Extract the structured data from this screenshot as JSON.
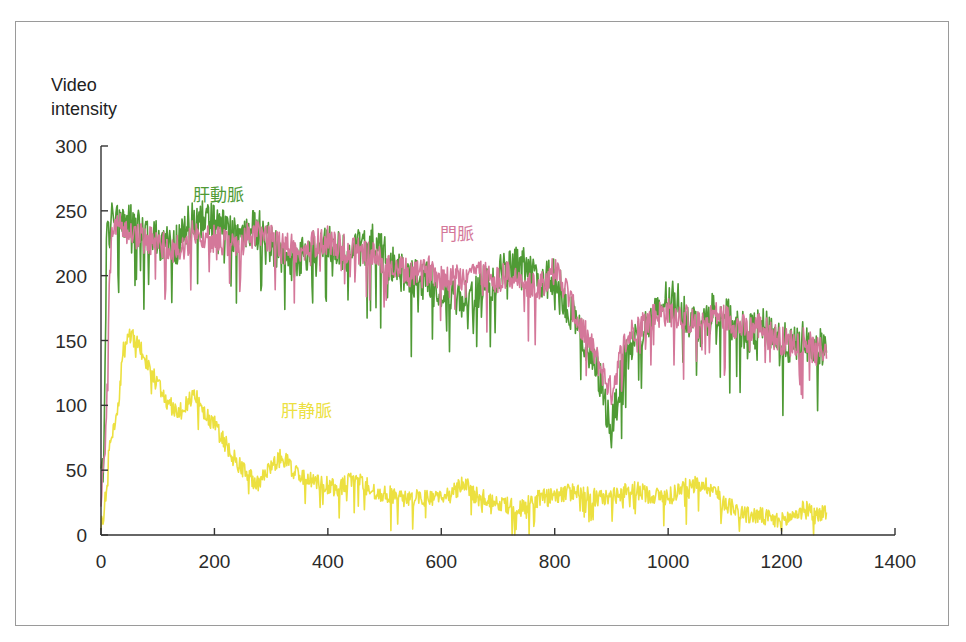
{
  "chart_data": {
    "type": "line",
    "title": "",
    "xlabel": "",
    "ylabel": "Video intensity",
    "ylabel_lines": [
      "Video",
      "intensity"
    ],
    "xlim": [
      0,
      1400
    ],
    "ylim": [
      0,
      300
    ],
    "x_ticks": [
      0,
      200,
      400,
      600,
      800,
      1000,
      1200,
      1400
    ],
    "y_ticks": [
      0,
      50,
      100,
      150,
      200,
      250,
      300
    ],
    "grid": false,
    "legend": "inline labels",
    "series": [
      {
        "name": "肝動脈",
        "color": "#4f9a35",
        "label_pos": {
          "left": 193,
          "top": 181
        },
        "x": [
          0,
          5,
          10,
          15,
          20,
          30,
          50,
          80,
          100,
          120,
          140,
          150,
          160,
          180,
          200,
          220,
          240,
          260,
          280,
          300,
          320,
          340,
          360,
          380,
          400,
          420,
          440,
          460,
          480,
          500,
          520,
          540,
          560,
          580,
          600,
          620,
          640,
          660,
          680,
          700,
          720,
          740,
          760,
          780,
          800,
          820,
          840,
          860,
          880,
          900,
          920,
          940,
          960,
          980,
          1000,
          1020,
          1040,
          1060,
          1080,
          1100,
          1120,
          1140,
          1160,
          1180,
          1200,
          1220,
          1240,
          1260,
          1280
        ],
        "values": [
          40,
          60,
          230,
          235,
          245,
          245,
          240,
          235,
          228,
          222,
          225,
          238,
          242,
          245,
          240,
          236,
          232,
          238,
          235,
          225,
          215,
          210,
          218,
          222,
          225,
          220,
          218,
          222,
          225,
          215,
          205,
          200,
          198,
          195,
          190,
          185,
          180,
          188,
          195,
          200,
          205,
          210,
          200,
          195,
          200,
          180,
          160,
          140,
          120,
          80,
          130,
          150,
          160,
          170,
          185,
          180,
          165,
          160,
          175,
          170,
          160,
          155,
          160,
          158,
          150,
          145,
          150,
          140,
          150
        ],
        "noise": 22
      },
      {
        "name": "門脈",
        "color": "#d4789a",
        "label_pos": {
          "left": 440,
          "top": 220
        },
        "x": [
          0,
          5,
          10,
          15,
          20,
          30,
          50,
          80,
          100,
          120,
          140,
          150,
          160,
          180,
          200,
          220,
          240,
          260,
          280,
          300,
          320,
          340,
          360,
          380,
          400,
          420,
          440,
          460,
          480,
          500,
          520,
          540,
          560,
          580,
          600,
          620,
          640,
          660,
          680,
          700,
          720,
          740,
          760,
          780,
          800,
          820,
          840,
          860,
          880,
          900,
          920,
          940,
          960,
          980,
          1000,
          1020,
          1040,
          1060,
          1080,
          1100,
          1120,
          1140,
          1160,
          1180,
          1200,
          1220,
          1240,
          1260,
          1280
        ],
        "values": [
          30,
          50,
          90,
          200,
          235,
          238,
          232,
          228,
          225,
          222,
          220,
          225,
          232,
          230,
          228,
          225,
          222,
          230,
          232,
          228,
          225,
          222,
          220,
          225,
          228,
          222,
          220,
          218,
          215,
          210,
          205,
          202,
          200,
          205,
          200,
          198,
          200,
          205,
          200,
          198,
          200,
          195,
          190,
          195,
          205,
          190,
          165,
          150,
          130,
          110,
          145,
          160,
          165,
          170,
          172,
          170,
          165,
          160,
          170,
          168,
          162,
          158,
          162,
          155,
          150,
          148,
          152,
          140,
          145
        ],
        "noise": 16
      },
      {
        "name": "肝静脈",
        "color": "#ece040",
        "label_pos": {
          "left": 281,
          "top": 397
        },
        "x": [
          0,
          5,
          10,
          15,
          20,
          30,
          40,
          50,
          60,
          80,
          100,
          120,
          140,
          160,
          170,
          180,
          200,
          220,
          240,
          260,
          280,
          300,
          320,
          340,
          360,
          380,
          400,
          420,
          440,
          460,
          480,
          500,
          520,
          540,
          560,
          580,
          600,
          620,
          640,
          660,
          680,
          700,
          720,
          740,
          760,
          780,
          800,
          820,
          840,
          860,
          880,
          900,
          920,
          940,
          960,
          980,
          1000,
          1020,
          1040,
          1060,
          1080,
          1100,
          1120,
          1140,
          1160,
          1180,
          1200,
          1220,
          1240,
          1260,
          1280
        ],
        "values": [
          5,
          15,
          40,
          70,
          80,
          100,
          145,
          155,
          150,
          135,
          115,
          100,
          95,
          108,
          105,
          95,
          85,
          70,
          55,
          45,
          40,
          55,
          60,
          50,
          45,
          40,
          38,
          35,
          45,
          40,
          35,
          32,
          30,
          28,
          28,
          30,
          30,
          32,
          40,
          30,
          28,
          25,
          22,
          20,
          25,
          30,
          28,
          32,
          35,
          30,
          28,
          30,
          32,
          35,
          32,
          30,
          30,
          35,
          38,
          40,
          35,
          25,
          20,
          15,
          15,
          12,
          10,
          15,
          20,
          15,
          18
        ],
        "noise": 10
      }
    ]
  }
}
